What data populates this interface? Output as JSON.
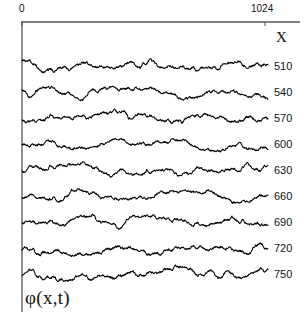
{
  "figure": {
    "y_axis_label": "φ(x,t)",
    "x_axis_label": "X"
  },
  "chart_data": {
    "type": "line",
    "title": "",
    "subtitle": "",
    "xlabel": "X",
    "ylabel": "φ(x,t)",
    "xlim": [
      0,
      1024
    ],
    "xtick_labels": [
      "0",
      "1024"
    ],
    "xticks": [
      0,
      1024
    ],
    "grid": false,
    "legend": "right-of-axis",
    "axis_color": "#555555",
    "trace_color": "#000000",
    "series_label_header": "X",
    "series": [
      {
        "name": "510",
        "baseline_y": 66,
        "seed": 11,
        "amp_fine": 2.6,
        "amp_mid": 3.4,
        "amp_slow": 4.6
      },
      {
        "name": "540",
        "baseline_y": 92,
        "seed": 27,
        "amp_fine": 2.5,
        "amp_mid": 3.6,
        "amp_slow": 4.8
      },
      {
        "name": "570",
        "baseline_y": 118,
        "seed": 43,
        "amp_fine": 2.7,
        "amp_mid": 3.5,
        "amp_slow": 5.0
      },
      {
        "name": "600",
        "baseline_y": 144,
        "seed": 59,
        "amp_fine": 2.4,
        "amp_mid": 3.7,
        "amp_slow": 5.2
      },
      {
        "name": "630",
        "baseline_y": 170,
        "seed": 71,
        "amp_fine": 2.6,
        "amp_mid": 3.8,
        "amp_slow": 5.4
      },
      {
        "name": "660",
        "baseline_y": 196,
        "seed": 89,
        "amp_fine": 2.5,
        "amp_mid": 3.6,
        "amp_slow": 5.3
      },
      {
        "name": "690",
        "baseline_y": 222,
        "seed": 103,
        "amp_fine": 2.7,
        "amp_mid": 3.9,
        "amp_slow": 5.5
      },
      {
        "name": "720",
        "baseline_y": 248,
        "seed": 127,
        "amp_fine": 2.6,
        "amp_mid": 3.8,
        "amp_slow": 5.6
      },
      {
        "name": "750",
        "baseline_y": 274,
        "seed": 149,
        "amp_fine": 2.8,
        "amp_mid": 3.7,
        "amp_slow": 5.4
      }
    ],
    "plot_geometry": {
      "left_px": 22,
      "right_px": 268,
      "top_axis_px": 22,
      "bottom_px": 286,
      "xtick_px": [
        22,
        265
      ]
    }
  }
}
